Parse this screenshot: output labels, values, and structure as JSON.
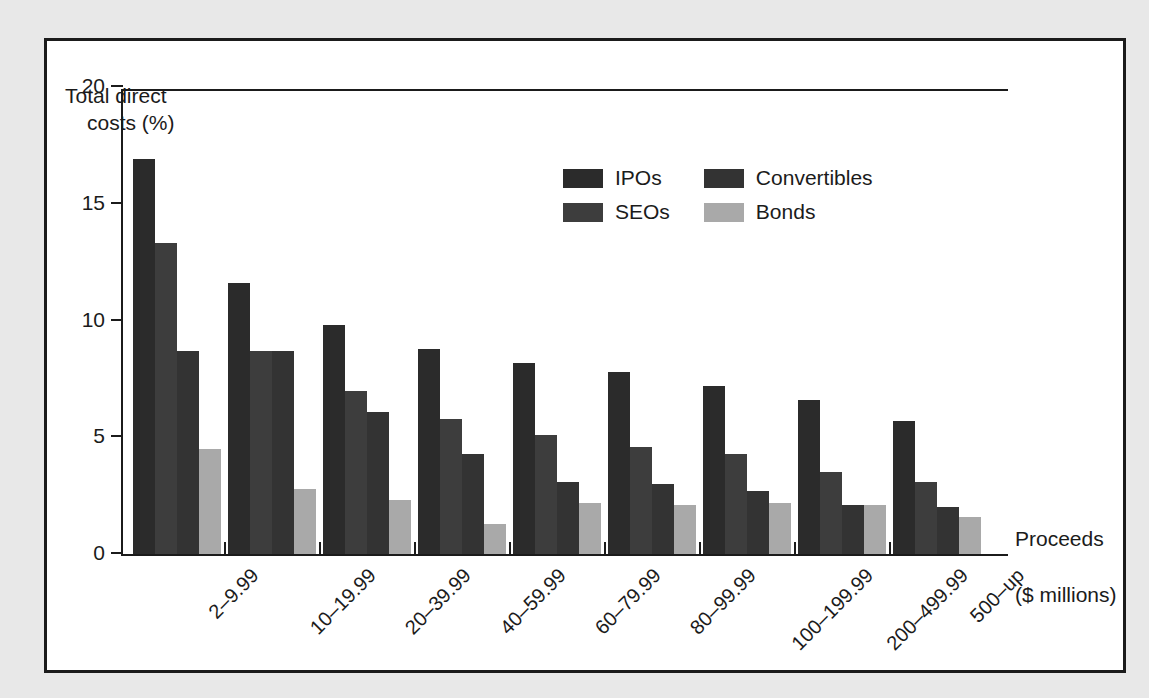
{
  "figure": {
    "y_axis_title_line1": "Total direct",
    "y_axis_title_line2": "costs (%)",
    "x_axis_title_line1": "Proceeds",
    "x_axis_title_line2": "($ millions)"
  },
  "colors": {
    "ipos": "#2b2b2b",
    "seos": "#3d3d3d",
    "convertibles": "#333333",
    "bonds": "#a9a9a9",
    "axis": "#1b1b1b",
    "panel_background": "#ffffff",
    "page_background": "#e8e8e8"
  },
  "chart_data": {
    "type": "bar",
    "title": "",
    "xlabel": "Proceeds ($ millions)",
    "ylabel": "Total direct costs (%)",
    "ylim": [
      0,
      20
    ],
    "yticks": [
      0,
      5,
      10,
      15,
      20
    ],
    "grid": false,
    "legend_position": "upper-center",
    "categories": [
      "2–9.99",
      "10–19.99",
      "20–39.99",
      "40–59.99",
      "60–79.99",
      "80–99.99",
      "100–199.99",
      "200–499.99",
      "500–up"
    ],
    "series": [
      {
        "name": "IPOs",
        "color": "#2b2b2b",
        "values": [
          16.9,
          11.6,
          9.8,
          8.8,
          8.2,
          7.8,
          7.2,
          6.6,
          5.7
        ]
      },
      {
        "name": "SEOs",
        "color": "#3d3d3d",
        "values": [
          13.3,
          8.7,
          7.0,
          5.8,
          5.1,
          4.6,
          4.3,
          3.5,
          3.1
        ]
      },
      {
        "name": "Convertibles",
        "color": "#333333",
        "values": [
          8.7,
          8.7,
          6.1,
          4.3,
          3.1,
          3.0,
          2.7,
          2.1,
          2.0
        ]
      },
      {
        "name": "Bonds",
        "color": "#a9a9a9",
        "values": [
          4.5,
          2.8,
          2.3,
          1.3,
          2.2,
          2.1,
          2.2,
          2.1,
          1.6
        ]
      }
    ],
    "legend": [
      {
        "label": "IPOs",
        "color": "#2b2b2b"
      },
      {
        "label": "Convertibles",
        "color": "#333333"
      },
      {
        "label": "SEOs",
        "color": "#3d3d3d"
      },
      {
        "label": "Bonds",
        "color": "#a9a9a9"
      }
    ]
  }
}
